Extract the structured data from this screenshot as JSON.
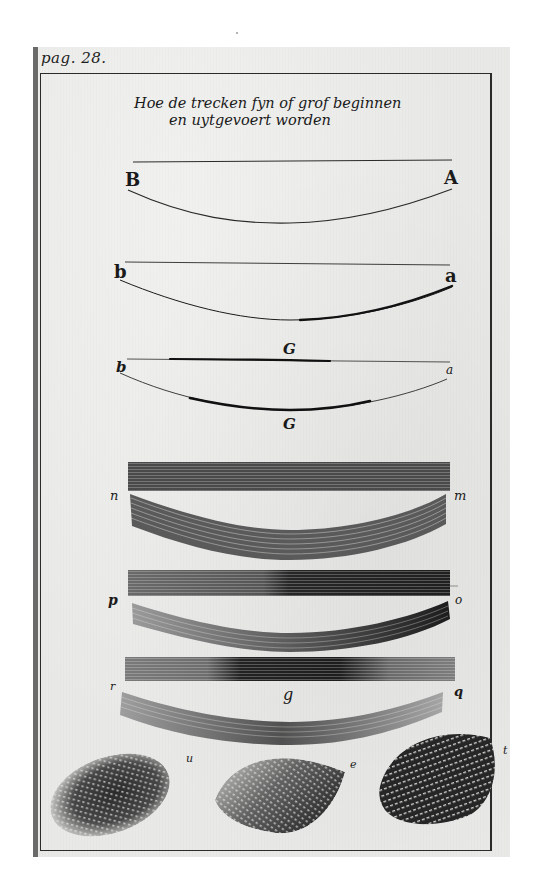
{
  "page": {
    "page_reference": "pag. 28.",
    "title_lines": [
      "Hoe de trecken fyn of grof beginnen",
      "en uytgevoert worden"
    ]
  },
  "figures": [
    {
      "id": "fig-1",
      "description": "thin straight line above a thin curved stroke",
      "labels": {
        "left": "B",
        "right": "A"
      }
    },
    {
      "id": "fig-2",
      "description": "straight line above a curve that starts fine and swells toward the right",
      "labels": {
        "left": "b",
        "right": "a"
      }
    },
    {
      "id": "fig-3",
      "description": "line and curve that swell in the middle",
      "labels": {
        "left": "b",
        "right": "a",
        "top": "G",
        "bottom": "G"
      }
    },
    {
      "id": "fig-4",
      "description": "uniform hatched band above a curved hatched band",
      "labels": {
        "left": "n",
        "right": "m"
      }
    },
    {
      "id": "fig-5",
      "description": "hatched band darkening to the right above a curved band darkening to the right",
      "labels": {
        "left": "p",
        "right": "o"
      }
    },
    {
      "id": "fig-6",
      "description": "hatched band darkest in the middle above a curved band",
      "labels": {
        "left": "r",
        "right": "q",
        "center": "g"
      }
    },
    {
      "id": "fig-7",
      "description": "three cross-hatched shading patches",
      "labels": {
        "patch_1": "u",
        "patch_2": "e",
        "patch_3": "t"
      }
    }
  ],
  "colors": {
    "paper": "#e9e9e7",
    "ink": "#1a1a1a",
    "spine": "#6a6a6a",
    "background": "#ffffff"
  }
}
